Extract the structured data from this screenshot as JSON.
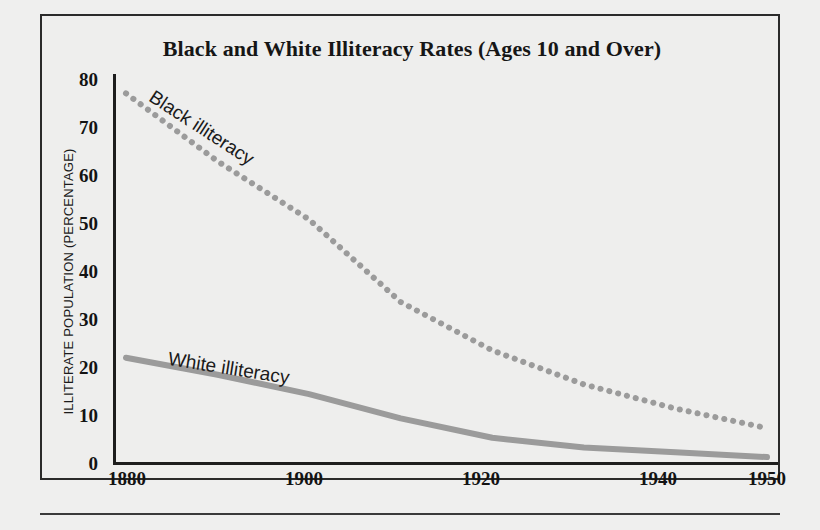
{
  "figure": {
    "title": "Black and White Illiteracy Rates (Ages 10 and Over)"
  },
  "chart_data": {
    "type": "line",
    "title": "Black and White Illiteracy Rates (Ages 10 and Over)",
    "xlabel": "",
    "ylabel": "ILLITERATE POPULATION (PERCENTAGE)",
    "xlim": [
      1880,
      1950
    ],
    "ylim": [
      0,
      80
    ],
    "grid": false,
    "legend_position": "inline-labels",
    "x_ticks": [
      "1880",
      "1900",
      "1920",
      "1940",
      "1950"
    ],
    "y_ticks": [
      "0",
      "10",
      "20",
      "30",
      "40",
      "50",
      "60",
      "70",
      "80"
    ],
    "x": [
      1880,
      1890,
      1900,
      1910,
      1920,
      1930,
      1940,
      1950
    ],
    "series": [
      {
        "name": "Black illiteracy",
        "label": "Black illiteracy",
        "style": "dotted",
        "color": "#9b9b9b",
        "values": [
          76,
          62,
          50,
          33,
          23,
          16,
          11,
          7
        ]
      },
      {
        "name": "White illiteracy",
        "label": "White illiteracy",
        "style": "solid",
        "color": "#9b9b9b",
        "values": [
          21.5,
          18,
          14,
          9,
          5,
          3,
          2,
          1
        ]
      }
    ]
  },
  "colors": {
    "line": "#9b9b9b",
    "axis": "#1d1d1d",
    "frame": "#2a2a2a",
    "background": "#efefee",
    "text": "#131313"
  }
}
